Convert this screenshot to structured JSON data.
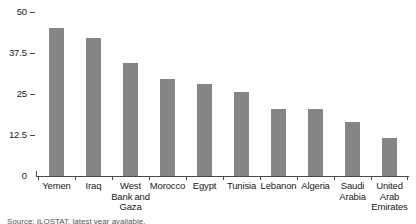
{
  "chart_data": {
    "type": "bar",
    "title": "",
    "subtitle": "",
    "xlabel": "",
    "ylabel": "",
    "ylim": [
      0,
      50
    ],
    "grid": false,
    "legend": false,
    "orientation": "vertical",
    "bar_color": "#858585",
    "axis_color": "#4a4a4a",
    "background": "#ffffff",
    "categories": [
      "Yemen",
      "Iraq",
      "West Bank and Gaza",
      "Morocco",
      "Egypt",
      "Tunisia",
      "Lebanon",
      "Algeria",
      "Saudi Arabia",
      "United Arab Emirates"
    ],
    "category_label_lines": [
      [
        "Yemen"
      ],
      [
        "Iraq"
      ],
      [
        "West",
        "Bank and",
        "Gaza"
      ],
      [
        "Morocco"
      ],
      [
        "Egypt"
      ],
      [
        "Tunisia"
      ],
      [
        "Lebanon"
      ],
      [
        "Algeria"
      ],
      [
        "Saudi",
        "Arabia"
      ],
      [
        "United",
        "Arab",
        "Emirates"
      ]
    ],
    "values": [
      45,
      42,
      34.5,
      29.5,
      28,
      25.5,
      20.5,
      20.5,
      16.5,
      11.5
    ],
    "yticks": [
      0,
      12.5,
      25,
      37.5,
      50
    ],
    "ytick_labels": [
      "0",
      "12.5",
      "25",
      "37.5",
      "50"
    ]
  },
  "source": {
    "text": "Source: ILOSTAT, latest year available."
  }
}
